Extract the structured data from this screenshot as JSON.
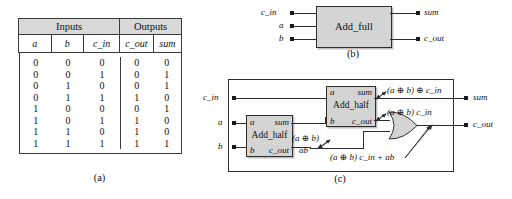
{
  "panel_a": {
    "caption": "(a)",
    "group_headers": [
      "Inputs",
      "Outputs"
    ],
    "columns": [
      "a",
      "b",
      "c_in",
      "c_out",
      "sum"
    ],
    "rows": [
      [
        "0",
        "0",
        "0",
        "0",
        "0"
      ],
      [
        "0",
        "0",
        "1",
        "0",
        "1"
      ],
      [
        "0",
        "1",
        "0",
        "0",
        "1"
      ],
      [
        "0",
        "1",
        "1",
        "1",
        "0"
      ],
      [
        "1",
        "0",
        "0",
        "0",
        "1"
      ],
      [
        "1",
        "0",
        "1",
        "1",
        "0"
      ],
      [
        "1",
        "1",
        "0",
        "1",
        "0"
      ],
      [
        "1",
        "1",
        "1",
        "1",
        "1"
      ]
    ]
  },
  "panel_b": {
    "caption": "(b)",
    "block_label": "Add_full",
    "inputs": [
      "c_in",
      "a",
      "b"
    ],
    "outputs": [
      "sum",
      "c_out"
    ]
  },
  "panel_c": {
    "caption": "(c)",
    "inputs": [
      "c_in",
      "a",
      "b"
    ],
    "outputs": [
      "sum",
      "c_out"
    ],
    "half_adder_1": {
      "name": "Add_half",
      "in_a": "a",
      "in_b": "b",
      "out_sum": "sum",
      "out_cout": "c_out"
    },
    "half_adder_2": {
      "name": "Add_half",
      "in_a": "a",
      "in_b": "b",
      "out_sum": "sum",
      "out_cout": "c_out"
    },
    "gate": "or-gate",
    "annotations": {
      "xor_ab": "(a ⊕ b)",
      "and_ab": "ab",
      "sum_expr": "(a ⊕ b) ⊕ c_in",
      "carry_term": "(a ⊕ b) c_in",
      "cout_expr": "(a ⊕ b) c_in + ab"
    }
  },
  "colors": {
    "block_fill": "#d4d4d4",
    "header_fill": "#d9d9d9",
    "line": "#2e2e2e",
    "text": "#111111"
  }
}
